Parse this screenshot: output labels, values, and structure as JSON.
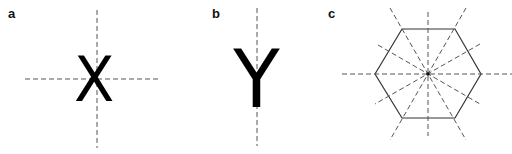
{
  "panels": [
    {
      "label": "a",
      "glyph": "X",
      "symmetry_axes": 2,
      "description": "Letter X with vertical and horizontal mirror axes"
    },
    {
      "label": "b",
      "glyph": "Y",
      "symmetry_axes": 1,
      "description": "Letter Y with a single vertical mirror axis"
    },
    {
      "label": "c",
      "glyph": "",
      "shape": "regular hexagon",
      "symmetry_axes": 6,
      "description": "Regular hexagon with six mirror axes through the center"
    }
  ],
  "colors": {
    "glyph": "#000000",
    "axis": "#555555",
    "outline": "#333333"
  }
}
